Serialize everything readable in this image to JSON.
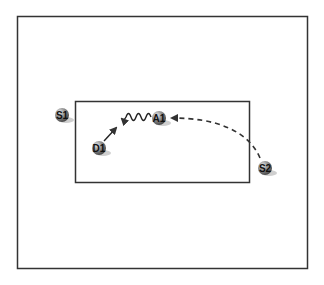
{
  "diagram": {
    "outer_frame": {
      "x": 17,
      "y": 16,
      "width": 290,
      "height": 252
    },
    "inner_region": {
      "x": 75,
      "y": 101,
      "width": 174,
      "height": 81
    },
    "nodes": [
      {
        "id": "S1",
        "label": "S1",
        "cx": 62,
        "cy": 115
      },
      {
        "id": "D1",
        "label": "D1",
        "cx": 99,
        "cy": 148
      },
      {
        "id": "A1",
        "label": "A1",
        "cx": 159,
        "cy": 118
      },
      {
        "id": "S2",
        "label": "S2",
        "cx": 265,
        "cy": 168
      }
    ],
    "edges": [
      {
        "from": "D1",
        "to": "A1-left",
        "style": "solid",
        "description": "straight arrow up-right"
      },
      {
        "from": "A1",
        "to": "left",
        "style": "wavy",
        "description": "wavy line with arrowhead pointing left"
      },
      {
        "from": "S2",
        "to": "A1",
        "style": "dashed",
        "description": "curved dashed arrow"
      }
    ],
    "colors": {
      "frame": "#333333",
      "node_fill": "#8a8a8a",
      "node_shadow": "#c8c8c8",
      "edge": "#333333"
    }
  }
}
